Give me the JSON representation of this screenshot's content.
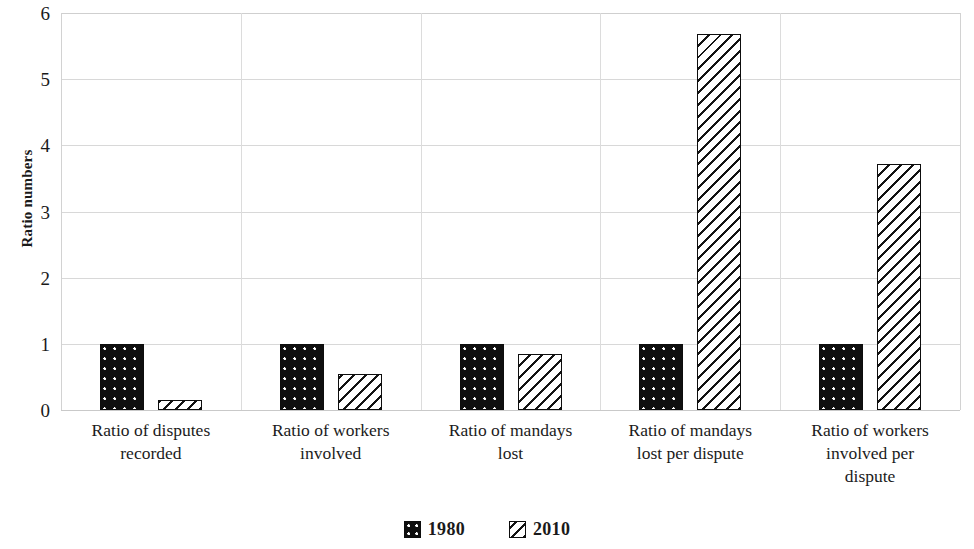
{
  "chart_data": {
    "type": "bar",
    "title": "",
    "xlabel": "",
    "ylabel": "Ratio numbers",
    "ylim": [
      0,
      6
    ],
    "ytick_labels": [
      "0",
      "1",
      "2",
      "3",
      "4",
      "5",
      "6"
    ],
    "ytick_values": [
      0,
      1,
      2,
      3,
      4,
      5,
      6
    ],
    "grid": true,
    "legend_position": "bottom",
    "categories": [
      "Ratio of disputes recorded",
      "Ratio of workers involved",
      "Ratio of mandays lost",
      "Ratio of mandays lost per dispute",
      "Ratio of workers involved per dispute"
    ],
    "category_lines": [
      [
        "Ratio of disputes",
        "recorded"
      ],
      [
        "Ratio of workers",
        "involved"
      ],
      [
        "Ratio of mandays",
        "lost"
      ],
      [
        "Ratio of mandays",
        "lost per dispute"
      ],
      [
        "Ratio of workers",
        "involved per",
        "dispute"
      ]
    ],
    "series": [
      {
        "name": "1980",
        "pattern": "black-dotted",
        "color": "#0f0f0f",
        "values": [
          1.0,
          1.0,
          1.0,
          1.0,
          1.0
        ]
      },
      {
        "name": "2010",
        "pattern": "diagonal-hatch",
        "color": "#ffffff",
        "values": [
          0.15,
          0.55,
          0.85,
          5.68,
          3.72
        ]
      }
    ]
  },
  "legend": {
    "items": [
      {
        "label": "1980",
        "swatch": "swatch-1980-dotted"
      },
      {
        "label": "2010",
        "swatch": "swatch-2010-hatched"
      }
    ]
  },
  "axis": {
    "y_title": "Ratio numbers"
  }
}
